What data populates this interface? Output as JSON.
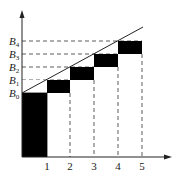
{
  "diagram": {
    "type": "step-approximation",
    "x_axis": {
      "ticks": [
        "1",
        "2",
        "3",
        "4",
        "5"
      ]
    },
    "y_axis": {
      "labels": [
        "B0",
        "B1",
        "B2",
        "B3",
        "B4"
      ]
    },
    "y_labels": [
      {
        "base": "B",
        "sub": "0"
      },
      {
        "base": "B",
        "sub": "1"
      },
      {
        "base": "B",
        "sub": "2"
      },
      {
        "base": "B",
        "sub": "3"
      },
      {
        "base": "B",
        "sub": "4"
      }
    ],
    "fill_color": "#000000",
    "line_color": "#222222"
  }
}
